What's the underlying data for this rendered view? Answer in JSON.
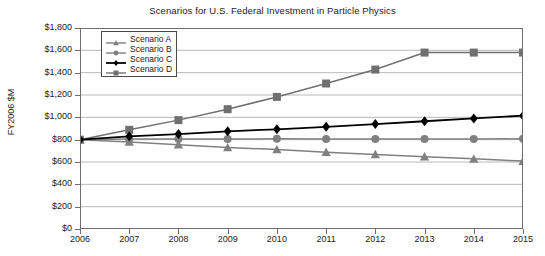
{
  "chart_data": {
    "type": "line",
    "title": "Scenarios for U.S. Federal Investment in Particle Physics",
    "xlabel": "",
    "ylabel": "FY2006 $M",
    "x": [
      2006,
      2007,
      2008,
      2009,
      2010,
      2011,
      2012,
      2013,
      2014,
      2015
    ],
    "categories": [
      "2006",
      "2007",
      "2008",
      "2009",
      "2010",
      "2011",
      "2012",
      "2013",
      "2014",
      "2015"
    ],
    "xlim": [
      2006,
      2015
    ],
    "ylim": [
      0,
      1800
    ],
    "ytick_values": [
      0,
      200,
      400,
      600,
      800,
      1000,
      1200,
      1400,
      1600,
      1800
    ],
    "ytick_labels": [
      "$0",
      "$200",
      "$400",
      "$600",
      "$800",
      "$1,000",
      "$1,200",
      "$1,400",
      "$1,600",
      "$1,800"
    ],
    "grid": "horizontal",
    "legend_position": "top-left-inside",
    "series": [
      {
        "name": "Scenario A",
        "marker": "triangle",
        "color": "#808080",
        "values": [
          800,
          780,
          755,
          730,
          712,
          688,
          668,
          648,
          628,
          608
        ]
      },
      {
        "name": "Scenario B",
        "marker": "circle",
        "color": "#808080",
        "values": [
          800,
          805,
          805,
          805,
          808,
          805,
          805,
          805,
          805,
          808
        ]
      },
      {
        "name": "Scenario C",
        "marker": "diamond",
        "color": "#000000",
        "values": [
          800,
          830,
          850,
          875,
          893,
          915,
          940,
          965,
          990,
          1015
        ]
      },
      {
        "name": "Scenario D",
        "marker": "square",
        "color": "#707070",
        "values": [
          800,
          888,
          975,
          1073,
          1183,
          1303,
          1428,
          1580,
          1580,
          1580
        ]
      }
    ]
  },
  "axis": {
    "frame_color": "#6e6e6e",
    "gridline_color": "#b9b9b9"
  }
}
